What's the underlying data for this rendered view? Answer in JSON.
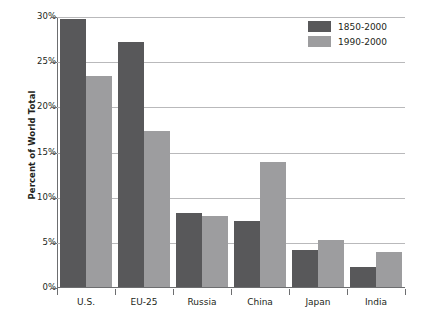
{
  "chart_data": {
    "type": "bar",
    "title": "",
    "xlabel": "",
    "ylabel": "Percent of World Total",
    "ylim": [
      0,
      30
    ],
    "ytick_labels": [
      "0%",
      "5%",
      "10%",
      "15%",
      "20%",
      "25%",
      "30%"
    ],
    "ytick_values": [
      0,
      5,
      10,
      15,
      20,
      25,
      30
    ],
    "grid": true,
    "legend_position": "top-right",
    "categories": [
      "U.S.",
      "EU-25",
      "Russia",
      "China",
      "Japan",
      "India"
    ],
    "series": [
      {
        "name": "1850-2000",
        "color": "#58585a",
        "values": [
          29.7,
          27.1,
          8.2,
          7.3,
          4.1,
          2.2
        ]
      },
      {
        "name": "1990-2000",
        "color": "#9d9d9f",
        "values": [
          23.4,
          17.3,
          7.9,
          13.8,
          5.2,
          3.9
        ]
      }
    ]
  },
  "legend": {
    "items": [
      {
        "label": "1850-2000",
        "color": "#58585a"
      },
      {
        "label": "1990-2000",
        "color": "#9d9d9f"
      }
    ]
  },
  "caption": {
    "text": ""
  }
}
